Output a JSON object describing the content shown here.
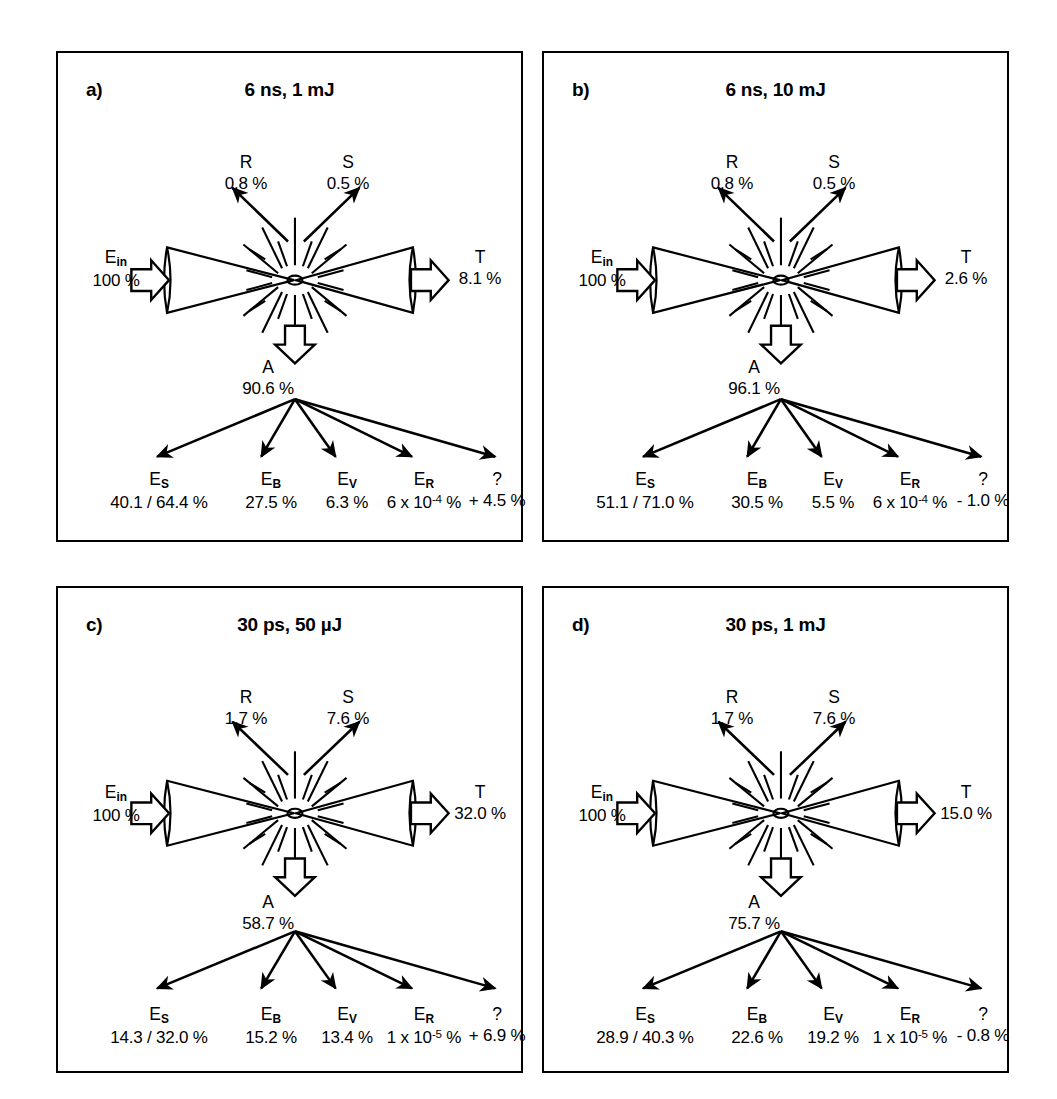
{
  "figure": {
    "type": "diagram",
    "panel_count": 4
  },
  "common": {
    "input_symbol": "E",
    "input_sub": "in",
    "input_value": "100 %",
    "reflection_symbol": "R",
    "scatter_symbol": "S",
    "transmission_symbol": "T",
    "absorption_symbol": "A",
    "unknown_symbol": "?",
    "channel_symbols": [
      {
        "sym": "E",
        "sub": "S"
      },
      {
        "sym": "E",
        "sub": "B"
      },
      {
        "sym": "E",
        "sub": "V"
      },
      {
        "sym": "E",
        "sub": "R"
      },
      {
        "sym": "?",
        "sub": ""
      }
    ],
    "icons": {
      "block_arrow_right": "block-arrow-right-icon",
      "block_arrow_down": "block-arrow-down-icon",
      "starburst": "plasma-starburst-icon",
      "beam": "focused-beam-hourglass-icon"
    }
  },
  "panels": [
    {
      "id": "a",
      "letter": "a)",
      "title": "6 ns, 1 mJ",
      "pulse_duration": "6 ns",
      "pulse_energy": "1 mJ",
      "E_in": "100 %",
      "R": "0.8 %",
      "S": "0.5 %",
      "T": "8.1 %",
      "A": "90.6 %",
      "channels": [
        {
          "sym": "E",
          "sub": "S",
          "value": "40.1 / 64.4 %"
        },
        {
          "sym": "E",
          "sub": "B",
          "value": "27.5 %"
        },
        {
          "sym": "E",
          "sub": "V",
          "value": "6.3 %"
        },
        {
          "sym": "E",
          "sub": "R",
          "value": "6 x 10<sup>-4</sup> %"
        },
        {
          "sym": "?",
          "sub": "",
          "value": "+ 4.5 %"
        }
      ]
    },
    {
      "id": "b",
      "letter": "b)",
      "title": "6 ns, 10 mJ",
      "pulse_duration": "6 ns",
      "pulse_energy": "10 mJ",
      "E_in": "100 %",
      "R": "0.8 %",
      "S": "0.5 %",
      "T": "2.6 %",
      "A": "96.1 %",
      "channels": [
        {
          "sym": "E",
          "sub": "S",
          "value": "51.1 / 71.0 %"
        },
        {
          "sym": "E",
          "sub": "B",
          "value": "30.5 %"
        },
        {
          "sym": "E",
          "sub": "V",
          "value": "5.5 %"
        },
        {
          "sym": "E",
          "sub": "R",
          "value": "6 x 10<sup>-4</sup> %"
        },
        {
          "sym": "?",
          "sub": "",
          "value": "- 1.0 %"
        }
      ]
    },
    {
      "id": "c",
      "letter": "c)",
      "title": "30 ps, 50 µJ",
      "pulse_duration": "30 ps",
      "pulse_energy": "50 µJ",
      "E_in": "100 %",
      "R": "1.7 %",
      "S": "7.6 %",
      "T": "32.0 %",
      "A": "58.7 %",
      "channels": [
        {
          "sym": "E",
          "sub": "S",
          "value": "14.3 / 32.0 %"
        },
        {
          "sym": "E",
          "sub": "B",
          "value": "15.2 %"
        },
        {
          "sym": "E",
          "sub": "V",
          "value": "13.4 %"
        },
        {
          "sym": "E",
          "sub": "R",
          "value": "1 x 10<sup>-5</sup> %"
        },
        {
          "sym": "?",
          "sub": "",
          "value": "+ 6.9 %"
        }
      ]
    },
    {
      "id": "d",
      "letter": "d)",
      "title": "30 ps, 1 mJ",
      "pulse_duration": "30 ps",
      "pulse_energy": "1 mJ",
      "E_in": "100 %",
      "R": "1.7 %",
      "S": "7.6 %",
      "T": "15.0 %",
      "A": "75.7 %",
      "channels": [
        {
          "sym": "E",
          "sub": "S",
          "value": "28.9 / 40.3 %"
        },
        {
          "sym": "E",
          "sub": "B",
          "value": "22.6 %"
        },
        {
          "sym": "E",
          "sub": "V",
          "value": "19.2 %"
        },
        {
          "sym": "E",
          "sub": "R",
          "value": "1 x 10<sup>-5</sup> %"
        },
        {
          "sym": "?",
          "sub": "",
          "value": "- 0.8 %"
        }
      ]
    }
  ],
  "colors": {
    "ink": "#000000",
    "background": "#ffffff"
  }
}
